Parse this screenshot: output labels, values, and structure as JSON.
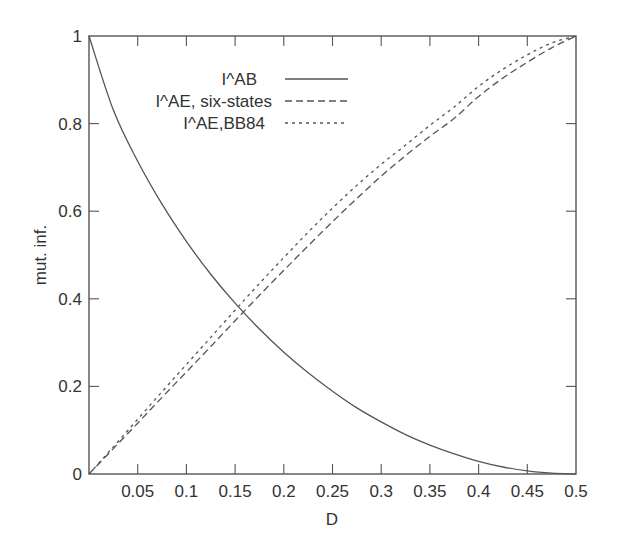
{
  "chart_data": {
    "type": "line",
    "title": "",
    "xlabel": "D",
    "ylabel": "mut. inf.",
    "xlim": [
      0,
      0.5
    ],
    "ylim": [
      0,
      1
    ],
    "grid": false,
    "legend_position": "upper-center-inside",
    "xticks": [
      0.05,
      0.1,
      0.15,
      0.2,
      0.25,
      0.3,
      0.35,
      0.4,
      0.45,
      0.5
    ],
    "xtick_labels": [
      "0.05",
      "0.1",
      "0.15",
      "0.2",
      "0.25",
      "0.3",
      "0.35",
      "0.4",
      "0.45",
      "0.5"
    ],
    "yticks": [
      0,
      0.2,
      0.4,
      0.6,
      0.8,
      1
    ],
    "ytick_labels": [
      "0",
      "0.2",
      "0.4",
      "0.6",
      "0.8",
      "1"
    ],
    "x": [
      0,
      0.025,
      0.05,
      0.075,
      0.1,
      0.125,
      0.15,
      0.175,
      0.2,
      0.225,
      0.25,
      0.275,
      0.3,
      0.325,
      0.35,
      0.375,
      0.4,
      0.425,
      0.45,
      0.475,
      0.5
    ],
    "series": [
      {
        "name": "I^AB",
        "style": "solid",
        "values": [
          1.0,
          0.831,
          0.714,
          0.616,
          0.531,
          0.456,
          0.39,
          0.331,
          0.278,
          0.231,
          0.189,
          0.151,
          0.119,
          0.09,
          0.066,
          0.046,
          0.029,
          0.016,
          0.007,
          0.002,
          0.0
        ]
      },
      {
        "name": "I^AE, six-states",
        "style": "dashed",
        "values": [
          0.0,
          0.058,
          0.116,
          0.175,
          0.233,
          0.291,
          0.35,
          0.408,
          0.465,
          0.521,
          0.576,
          0.629,
          0.68,
          0.727,
          0.771,
          0.812,
          0.862,
          0.904,
          0.94,
          0.973,
          1.0
        ]
      },
      {
        "name": "I^AE,BB84",
        "style": "dotted",
        "values": [
          0.0,
          0.062,
          0.125,
          0.188,
          0.25,
          0.312,
          0.374,
          0.435,
          0.494,
          0.552,
          0.607,
          0.659,
          0.707,
          0.751,
          0.796,
          0.838,
          0.885,
          0.924,
          0.957,
          0.984,
          1.0
        ]
      }
    ]
  },
  "legend": {
    "items": [
      {
        "label": "I^AB",
        "style": "solid"
      },
      {
        "label": "I^AE, six-states",
        "style": "dashed"
      },
      {
        "label": "I^AE,BB84",
        "style": "dotted"
      }
    ]
  },
  "colors": {
    "line": "#555555",
    "text": "#333333",
    "background": "#ffffff"
  }
}
